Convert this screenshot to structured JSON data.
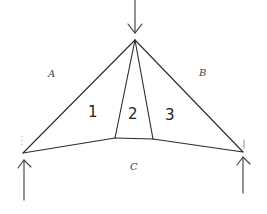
{
  "diagram": {
    "type": "truss-force-diagram",
    "region_labels": {
      "A": "A",
      "B": "B",
      "C": "C"
    },
    "member_labels": {
      "m1": "1",
      "m2": "2",
      "m3": "3"
    },
    "nodes": [
      {
        "id": "apex",
        "x": 135,
        "y": 40
      },
      {
        "id": "left_support",
        "x": 23,
        "y": 153
      },
      {
        "id": "right_support",
        "x": 243,
        "y": 152
      },
      {
        "id": "inner_left",
        "x": 115,
        "y": 138
      },
      {
        "id": "inner_right",
        "x": 153,
        "y": 139
      }
    ],
    "edges": [
      [
        "apex",
        "left_support"
      ],
      [
        "apex",
        "right_support"
      ],
      [
        "apex",
        "inner_left"
      ],
      [
        "apex",
        "inner_right"
      ],
      [
        "left_support",
        "inner_left"
      ],
      [
        "inner_left",
        "inner_right"
      ],
      [
        "inner_right",
        "right_support"
      ]
    ],
    "loads": [
      {
        "id": "top_load",
        "direction": "down",
        "at": "apex"
      },
      {
        "id": "left_reaction",
        "direction": "up",
        "at": "left_support"
      },
      {
        "id": "right_reaction",
        "direction": "up",
        "at": "right_support"
      }
    ]
  }
}
